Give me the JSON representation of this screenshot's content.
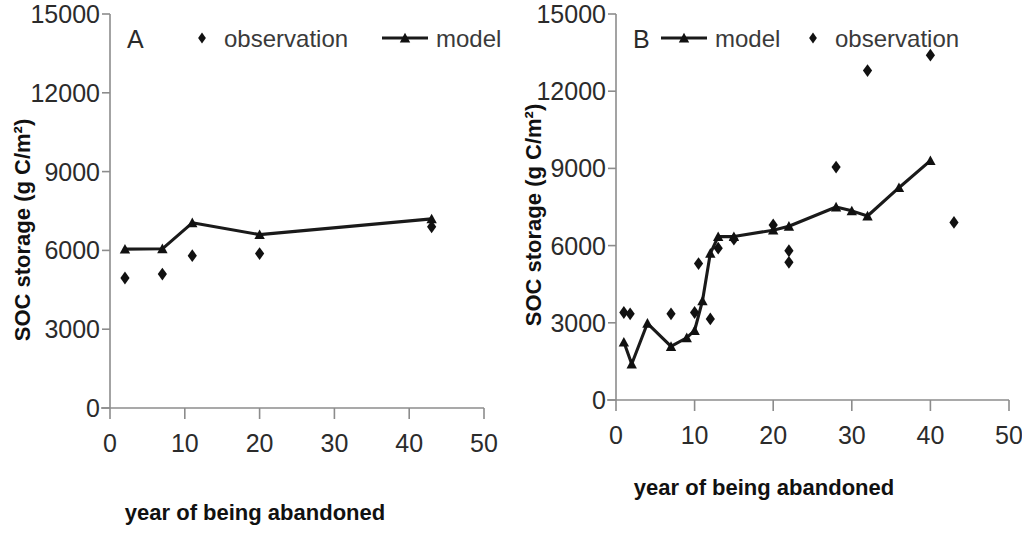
{
  "figure": {
    "background_color": "#ffffff",
    "series_color": "#111111",
    "axis_color": "#8c8c8c"
  },
  "axes": {
    "x_title": "year of being abandoned",
    "y_title": "SOC storage (g C/m²)",
    "x_ticks": [
      "0",
      "10",
      "20",
      "30",
      "40",
      "50"
    ],
    "y_ticks": [
      "0",
      "3000",
      "6000",
      "9000",
      "12000",
      "15000"
    ],
    "xlim": [
      0,
      50
    ],
    "ylim": [
      0,
      15000
    ]
  },
  "panels": [
    {
      "id": "A",
      "letter": "A",
      "legend": [
        {
          "key": "observation",
          "label": "observation",
          "marker": "diamond"
        },
        {
          "key": "model",
          "label": "model",
          "marker": "line-triangle"
        }
      ]
    },
    {
      "id": "B",
      "letter": "B",
      "legend": [
        {
          "key": "model",
          "label": "model",
          "marker": "line-triangle"
        },
        {
          "key": "observation",
          "label": "observation",
          "marker": "diamond"
        }
      ]
    }
  ],
  "chart_data": [
    {
      "type": "scatter",
      "panel": "A",
      "title": "A",
      "xlabel": "year of being abandoned",
      "ylabel": "SOC storage (g C/m²)",
      "xlim": [
        0,
        50
      ],
      "ylim": [
        0,
        15000
      ],
      "xticks": [
        0,
        10,
        20,
        30,
        40,
        50
      ],
      "yticks": [
        0,
        3000,
        6000,
        9000,
        12000,
        15000
      ],
      "grid": false,
      "legend_position": "top-center",
      "series": [
        {
          "name": "model",
          "type": "line",
          "marker": "triangle",
          "x": [
            2,
            7,
            11,
            20,
            43
          ],
          "values": [
            6050,
            6060,
            7050,
            6600,
            7200
          ]
        },
        {
          "name": "observation",
          "type": "scatter",
          "marker": "diamond",
          "x": [
            2,
            7,
            11,
            20,
            43
          ],
          "values": [
            4950,
            5100,
            5800,
            5880,
            6900
          ]
        }
      ]
    },
    {
      "type": "scatter",
      "panel": "B",
      "title": "B",
      "xlabel": "year of being abandoned",
      "ylabel": "SOC storage (g C/m²)",
      "xlim": [
        0,
        50
      ],
      "ylim": [
        0,
        15000
      ],
      "xticks": [
        0,
        10,
        20,
        30,
        40,
        50
      ],
      "yticks": [
        0,
        3000,
        6000,
        9000,
        12000,
        15000
      ],
      "grid": false,
      "legend_position": "top-center",
      "series": [
        {
          "name": "model",
          "type": "line",
          "marker": "triangle",
          "x": [
            1,
            2,
            4,
            7,
            9,
            10,
            11,
            12,
            13,
            15,
            20,
            22,
            28,
            30,
            32,
            36,
            40
          ],
          "values": [
            2250,
            1400,
            2980,
            2080,
            2420,
            2700,
            3850,
            5700,
            6350,
            6350,
            6600,
            6750,
            7500,
            7350,
            7150,
            8250,
            9300
          ]
        },
        {
          "name": "observation",
          "type": "scatter",
          "marker": "diamond",
          "x": [
            1,
            1.8,
            7,
            10,
            12,
            10.5,
            13,
            15,
            20,
            22,
            22,
            28,
            32,
            40,
            43
          ],
          "values": [
            3400,
            3350,
            3350,
            3400,
            3150,
            5300,
            5900,
            6250,
            6800,
            5800,
            5350,
            9050,
            12800,
            13400,
            6900
          ]
        }
      ]
    }
  ]
}
